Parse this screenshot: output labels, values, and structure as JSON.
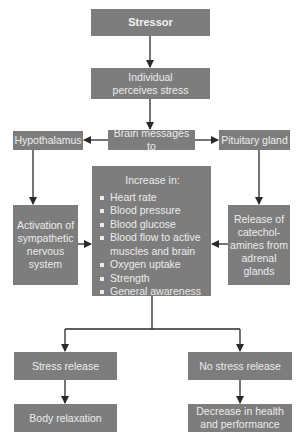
{
  "diagram": {
    "stressor": "Stressor",
    "perceives": "Individual perceives stress",
    "brain_messages": "Brain messages to",
    "hypothalamus": "Hypothalamus",
    "pituitary": "Pituitary gland",
    "activation": "Activation of sympathetic nervous system",
    "release": "Release of catechol-amines from adrenal glands",
    "increase": {
      "title": "Increase in:",
      "items": [
        "Heart rate",
        "Blood pressure",
        "Blood glucose",
        "Blood flow to active muscles and brain",
        "Oxygen uptake",
        "Strength",
        "General awareness"
      ]
    },
    "stress_release": "Stress release",
    "no_stress_release": "No stress release",
    "body_relaxation": "Body relaxation",
    "decrease": "Decrease in health and performance"
  },
  "colors": {
    "box_fill": "#7d7d7d",
    "box_text": "#ececec",
    "arrow": "#2a2a2a"
  }
}
